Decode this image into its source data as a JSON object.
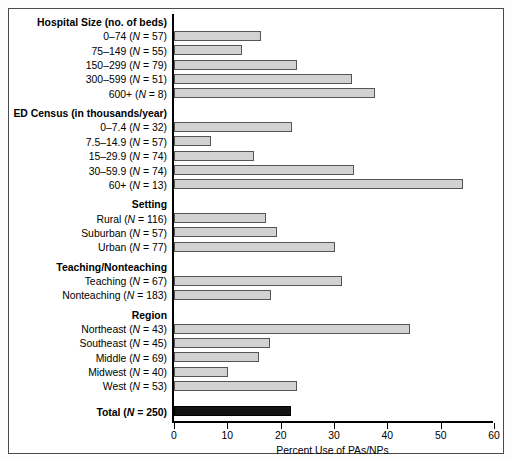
{
  "chart_data": {
    "type": "bar",
    "orientation": "horizontal",
    "title": "",
    "xlabel": "Percent Use of PAs/NPs",
    "ylabel": "",
    "xlim": [
      0,
      60
    ],
    "xticks": [
      0,
      10,
      20,
      30,
      40,
      50,
      60
    ],
    "grid": false,
    "legend": false,
    "categories": [
      "0–74 (N = 57)",
      "75–149 (N = 55)",
      "150–299 (N = 79)",
      "300–599 (N = 51)",
      "600+ (N = 8)",
      "0–7.4 (N = 32)",
      "7.5–14.9 (N = 57)",
      "15–29.9 (N = 74)",
      "30–59.9 (N = 74)",
      "60+ (N = 13)",
      "Rural (N = 116)",
      "Suburban (N = 57)",
      "Urban (N = 77)",
      "Teaching (N = 67)",
      "Nonteaching (N = 183)",
      "Northeast (N = 43)",
      "Southeast (N = 45)",
      "Middle (N = 69)",
      "Midwest (N = 40)",
      "West (N = 53)",
      "Total (N = 250)"
    ],
    "values": [
      16.3,
      12.8,
      23.0,
      33.4,
      37.6,
      22.2,
      7.0,
      15.0,
      33.7,
      54.2,
      17.2,
      19.4,
      30.2,
      31.5,
      18.2,
      44.2,
      18.0,
      15.9,
      10.2,
      23.1,
      22.0
    ],
    "groups": [
      {
        "heading": "Hospital Size (no. of beds)",
        "rows": [
          {
            "label": "0–74 (",
            "italic": "N",
            "label_end": " = 57)",
            "value": 16.3
          },
          {
            "label": "75–149 (",
            "italic": "N",
            "label_end": " = 55)",
            "value": 12.8
          },
          {
            "label": "150–299 (",
            "italic": "N",
            "label_end": " = 79)",
            "value": 23.0
          },
          {
            "label": "300–599 (",
            "italic": "N",
            "label_end": " = 51)",
            "value": 33.4
          },
          {
            "label": "600+ (",
            "italic": "N",
            "label_end": " = 8)",
            "value": 37.6
          }
        ]
      },
      {
        "heading": "ED Census (in thousands/year)",
        "rows": [
          {
            "label": "0–7.4 (",
            "italic": "N",
            "label_end": " = 32)",
            "value": 22.2
          },
          {
            "label": "7.5–14.9 (",
            "italic": "N",
            "label_end": " = 57)",
            "value": 7.0
          },
          {
            "label": "15–29.9 (",
            "italic": "N",
            "label_end": " = 74)",
            "value": 15.0
          },
          {
            "label": "30–59.9 (",
            "italic": "N",
            "label_end": " = 74)",
            "value": 33.7
          },
          {
            "label": "60+ (",
            "italic": "N",
            "label_end": " = 13)",
            "value": 54.2
          }
        ]
      },
      {
        "heading": "Setting",
        "rows": [
          {
            "label": "Rural (",
            "italic": "N",
            "label_end": " = 116)",
            "value": 17.2
          },
          {
            "label": "Suburban (",
            "italic": "N",
            "label_end": " = 57)",
            "value": 19.4
          },
          {
            "label": "Urban (",
            "italic": "N",
            "label_end": " = 77)",
            "value": 30.2
          }
        ]
      },
      {
        "heading": "Teaching/Nonteaching",
        "rows": [
          {
            "label": "Teaching (",
            "italic": "N",
            "label_end": " = 67)",
            "value": 31.5
          },
          {
            "label": "Nonteaching (",
            "italic": "N",
            "label_end": " = 183)",
            "value": 18.2
          }
        ]
      },
      {
        "heading": "Region",
        "rows": [
          {
            "label": "Northeast (",
            "italic": "N",
            "label_end": " = 43)",
            "value": 44.2
          },
          {
            "label": "Southeast (",
            "italic": "N",
            "label_end": " = 45)",
            "value": 18.0
          },
          {
            "label": "Middle (",
            "italic": "N",
            "label_end": " = 69)",
            "value": 15.9
          },
          {
            "label": "Midwest (",
            "italic": "N",
            "label_end": " = 40)",
            "value": 10.2
          },
          {
            "label": "West (",
            "italic": "N",
            "label_end": " = 53)",
            "value": 23.1
          }
        ]
      },
      {
        "heading": "",
        "rows": [
          {
            "label": "Total (",
            "italic": "N",
            "label_end": " = 250)",
            "value": 22.0,
            "total": true
          }
        ]
      }
    ]
  },
  "colors": {
    "bar_fill": "#d2d2d2",
    "bar_stroke": "#555555",
    "total_fill": "#141414",
    "axis": "#000000",
    "frame": "#4a4a4a",
    "background": "#ffffff"
  }
}
